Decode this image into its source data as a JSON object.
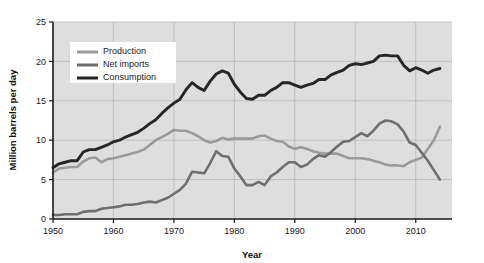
{
  "chart_data": {
    "type": "line",
    "title": "",
    "xlabel": "Year",
    "ylabel": "Million barrels per day",
    "xlim": [
      1950,
      2016
    ],
    "ylim": [
      0,
      25
    ],
    "xticks": [
      1950,
      1960,
      1970,
      1980,
      1990,
      2000,
      2010
    ],
    "yticks": [
      0,
      5,
      10,
      15,
      20,
      25
    ],
    "grid": true,
    "legend_position": "upper-left",
    "plot_background": "#dedede",
    "x": [
      1950,
      1951,
      1952,
      1953,
      1954,
      1955,
      1956,
      1957,
      1958,
      1959,
      1960,
      1961,
      1962,
      1963,
      1964,
      1965,
      1966,
      1967,
      1968,
      1969,
      1970,
      1971,
      1972,
      1973,
      1974,
      1975,
      1976,
      1977,
      1978,
      1979,
      1980,
      1981,
      1982,
      1983,
      1984,
      1985,
      1986,
      1987,
      1988,
      1989,
      1990,
      1991,
      1992,
      1993,
      1994,
      1995,
      1996,
      1997,
      1998,
      1999,
      2000,
      2001,
      2002,
      2003,
      2004,
      2005,
      2006,
      2007,
      2008,
      2009,
      2010,
      2011,
      2012,
      2013,
      2014
    ],
    "series": [
      {
        "name": "Production",
        "color": "#9a9a9a",
        "width": 2.6,
        "values": [
          5.9,
          6.4,
          6.5,
          6.6,
          6.6,
          7.3,
          7.7,
          7.8,
          7.2,
          7.6,
          7.7,
          7.9,
          8.1,
          8.3,
          8.5,
          8.8,
          9.4,
          10.0,
          10.4,
          10.8,
          11.3,
          11.2,
          11.2,
          10.9,
          10.5,
          10.0,
          9.7,
          9.9,
          10.3,
          10.1,
          10.2,
          10.2,
          10.2,
          10.2,
          10.5,
          10.6,
          10.2,
          9.9,
          9.8,
          9.2,
          8.9,
          9.1,
          8.9,
          8.6,
          8.4,
          8.3,
          8.3,
          8.3,
          8.0,
          7.7,
          7.7,
          7.7,
          7.6,
          7.4,
          7.2,
          6.9,
          6.8,
          6.8,
          6.7,
          7.2,
          7.5,
          7.8,
          8.9,
          10.0,
          11.7
        ]
      },
      {
        "name": "Net imports",
        "color": "#6e6e6e",
        "width": 2.6,
        "values": [
          0.5,
          0.5,
          0.6,
          0.6,
          0.6,
          0.9,
          1.0,
          1.0,
          1.3,
          1.4,
          1.5,
          1.6,
          1.8,
          1.8,
          1.9,
          2.1,
          2.2,
          2.1,
          2.4,
          2.7,
          3.2,
          3.7,
          4.5,
          6.0,
          5.9,
          5.8,
          7.1,
          8.6,
          8.0,
          7.9,
          6.4,
          5.4,
          4.3,
          4.3,
          4.7,
          4.3,
          5.4,
          5.9,
          6.6,
          7.2,
          7.2,
          6.6,
          6.9,
          7.6,
          8.1,
          7.9,
          8.5,
          9.2,
          9.8,
          9.9,
          10.4,
          10.9,
          10.5,
          11.2,
          12.1,
          12.5,
          12.4,
          12.0,
          11.1,
          9.7,
          9.4,
          8.4,
          7.4,
          6.2,
          5.0
        ]
      },
      {
        "name": "Consumption",
        "color": "#262626",
        "width": 2.9,
        "values": [
          6.5,
          7.0,
          7.2,
          7.4,
          7.4,
          8.5,
          8.8,
          8.8,
          9.1,
          9.4,
          9.8,
          10.0,
          10.4,
          10.7,
          11.0,
          11.5,
          12.1,
          12.6,
          13.4,
          14.1,
          14.7,
          15.2,
          16.4,
          17.3,
          16.7,
          16.3,
          17.5,
          18.4,
          18.8,
          18.5,
          17.1,
          16.1,
          15.3,
          15.2,
          15.7,
          15.7,
          16.3,
          16.7,
          17.3,
          17.3,
          17.0,
          16.7,
          17.0,
          17.2,
          17.7,
          17.7,
          18.3,
          18.6,
          18.9,
          19.5,
          19.7,
          19.6,
          19.8,
          20.0,
          20.7,
          20.8,
          20.7,
          20.7,
          19.5,
          18.8,
          19.2,
          18.9,
          18.5,
          18.9,
          19.1
        ]
      }
    ],
    "legend": {
      "items": [
        {
          "label": "Production",
          "color": "#9a9a9a"
        },
        {
          "label": "Net imports",
          "color": "#6e6e6e"
        },
        {
          "label": "Consumption",
          "color": "#262626"
        }
      ]
    }
  }
}
